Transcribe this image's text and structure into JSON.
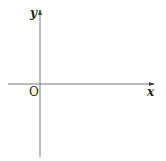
{
  "diagram": {
    "type": "cartesian-axes",
    "x_axis_label": "x",
    "y_axis_label": "y",
    "origin_label": "O",
    "axis_color": "#555555"
  }
}
